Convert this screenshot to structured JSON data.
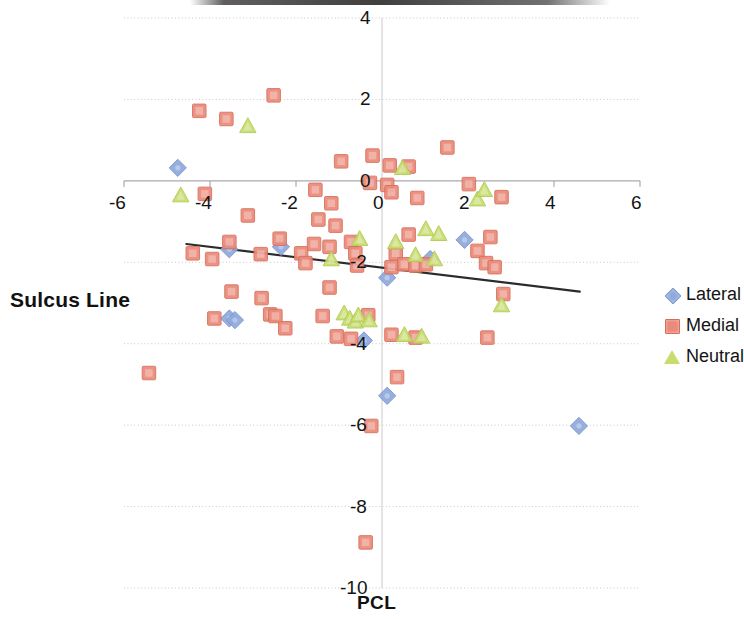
{
  "chart_data": {
    "type": "scatter",
    "title": "",
    "xlabel": "PCL",
    "ylabel": "Sulcus Line",
    "xlim": [
      -6,
      6
    ],
    "ylim": [
      -10,
      4
    ],
    "grid": true,
    "legend_position": "right",
    "x_ticks": [
      "-6",
      "-4",
      "-2",
      "0",
      "2",
      "4",
      "6"
    ],
    "x_tick_values": [
      -6,
      -4,
      -2,
      0,
      2,
      4,
      6
    ],
    "y_ticks": [
      "4",
      "2",
      "0",
      "-2",
      "-4",
      "-6",
      "-8",
      "-10"
    ],
    "y_tick_values": [
      4,
      2,
      0,
      -2,
      -4,
      -6,
      -8,
      -10
    ],
    "trendline": {
      "x0": -4.55,
      "y0": -1.55,
      "x1": 4.6,
      "y1": -2.72
    },
    "series": [
      {
        "name": "Lateral",
        "marker": "diamond",
        "color": "#90a9dd",
        "points": [
          [
            -4.75,
            0.32
          ],
          [
            -3.55,
            -1.68
          ],
          [
            -2.35,
            -1.62
          ],
          [
            -3.55,
            -3.38
          ],
          [
            -3.42,
            -3.42
          ],
          [
            0.12,
            -2.38
          ],
          [
            1.92,
            -1.45
          ],
          [
            1.12,
            -1.92
          ],
          [
            -0.42,
            -3.92
          ],
          [
            0.12,
            -5.28
          ],
          [
            4.58,
            -6.02
          ]
        ]
      },
      {
        "name": "Medial",
        "marker": "square",
        "color": "#ea8a7a",
        "points": [
          [
            -2.52,
            2.1
          ],
          [
            -4.25,
            1.72
          ],
          [
            -3.62,
            1.52
          ],
          [
            -0.95,
            0.48
          ],
          [
            -0.22,
            0.62
          ],
          [
            0.18,
            0.38
          ],
          [
            0.62,
            0.35
          ],
          [
            1.52,
            0.82
          ],
          [
            -0.28,
            -0.05
          ],
          [
            0.12,
            -0.1
          ],
          [
            0.22,
            -0.28
          ],
          [
            2.02,
            -0.08
          ],
          [
            -4.12,
            -0.32
          ],
          [
            -1.55,
            -0.22
          ],
          [
            -1.18,
            -0.55
          ],
          [
            0.82,
            -0.42
          ],
          [
            2.78,
            -0.4
          ],
          [
            -3.12,
            -0.85
          ],
          [
            -1.48,
            -0.95
          ],
          [
            -1.08,
            -1.1
          ],
          [
            0.62,
            -1.32
          ],
          [
            2.52,
            -1.38
          ],
          [
            -3.55,
            -1.5
          ],
          [
            -2.38,
            -1.42
          ],
          [
            -1.58,
            -1.55
          ],
          [
            -1.22,
            -1.62
          ],
          [
            -0.72,
            -1.5
          ],
          [
            2.22,
            -1.72
          ],
          [
            -4.4,
            -1.78
          ],
          [
            -3.95,
            -1.92
          ],
          [
            -2.82,
            -1.8
          ],
          [
            -1.88,
            -1.78
          ],
          [
            -0.62,
            -1.78
          ],
          [
            0.32,
            -1.78
          ],
          [
            -1.78,
            -2.02
          ],
          [
            -0.58,
            -2.08
          ],
          [
            0.22,
            -2.12
          ],
          [
            0.52,
            -2.05
          ],
          [
            0.78,
            -2.08
          ],
          [
            1.02,
            -2.05
          ],
          [
            2.42,
            -2.02
          ],
          [
            2.62,
            -2.12
          ],
          [
            -3.5,
            -2.72
          ],
          [
            -2.8,
            -2.88
          ],
          [
            -1.22,
            -2.62
          ],
          [
            2.82,
            -2.78
          ],
          [
            -3.9,
            -3.38
          ],
          [
            -2.6,
            -3.28
          ],
          [
            -2.48,
            -3.32
          ],
          [
            -1.38,
            -3.32
          ],
          [
            -0.32,
            -3.3
          ],
          [
            -2.25,
            -3.62
          ],
          [
            -1.05,
            -3.82
          ],
          [
            -0.72,
            -3.88
          ],
          [
            0.22,
            -3.78
          ],
          [
            0.78,
            -3.85
          ],
          [
            2.45,
            -3.85
          ],
          [
            -5.42,
            -4.72
          ],
          [
            0.35,
            -4.82
          ],
          [
            -0.25,
            -6.02
          ],
          [
            -0.38,
            -8.88
          ]
        ]
      },
      {
        "name": "Neutral",
        "marker": "triangle",
        "color": "#c8dd6f",
        "points": [
          [
            -3.12,
            1.35
          ],
          [
            -4.68,
            -0.35
          ],
          [
            0.48,
            0.32
          ],
          [
            2.22,
            -0.45
          ],
          [
            2.38,
            -0.22
          ],
          [
            1.02,
            -1.18
          ],
          [
            1.32,
            -1.3
          ],
          [
            -1.18,
            -1.92
          ],
          [
            -0.52,
            -1.42
          ],
          [
            0.32,
            -1.5
          ],
          [
            0.78,
            -1.82
          ],
          [
            1.22,
            -1.92
          ],
          [
            -0.88,
            -3.25
          ],
          [
            -0.75,
            -3.38
          ],
          [
            -0.62,
            -3.45
          ],
          [
            -0.55,
            -3.3
          ],
          [
            -0.3,
            -3.42
          ],
          [
            0.52,
            -3.78
          ],
          [
            0.92,
            -3.82
          ],
          [
            2.78,
            -3.05
          ]
        ]
      }
    ]
  },
  "legend": {
    "items": [
      {
        "label": "Lateral",
        "marker": "diamond"
      },
      {
        "label": "Medial",
        "marker": "square"
      },
      {
        "label": "Neutral",
        "marker": "triangle"
      }
    ]
  }
}
